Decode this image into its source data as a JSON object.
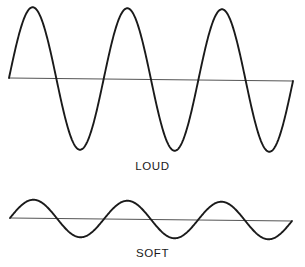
{
  "figure": {
    "background_color": "#ffffff",
    "wave_color": "#1a1a1a",
    "axis_color": "#555555",
    "width": 305,
    "height": 267
  },
  "waveforms": [
    {
      "id": "loud-waveform",
      "caption": "LOUD",
      "description": "high amplitude sound wave",
      "baseline_y": 79.5,
      "baseline_left_y": 78,
      "baseline_right_y": 81,
      "x_start": 9,
      "x_end": 293,
      "amplitude": 71,
      "cycles": 3,
      "peak_y": 9,
      "trough_y": 152,
      "peak_x": [
        30,
        126,
        222
      ],
      "trough_x": [
        80,
        174,
        270
      ],
      "stroke_width": 1.9
    },
    {
      "id": "soft-waveform",
      "caption": "SOFT",
      "description": "low amplitude sound wave",
      "baseline_y": 219,
      "baseline_left_y": 218,
      "baseline_right_y": 221,
      "x_start": 10,
      "x_end": 292,
      "amplitude": 18.5,
      "cycles": 3,
      "peak_y": 200.5,
      "trough_y": 237.5,
      "peak_x": [
        31,
        125,
        220
      ],
      "trough_x": [
        78,
        172,
        267
      ],
      "stroke_width": 1.9
    }
  ],
  "chart_data": {
    "type": "line",
    "title": "",
    "xlabel": "",
    "ylabel": "",
    "grid": false,
    "legend": "none",
    "annotations": [
      "LOUD",
      "SOFT"
    ],
    "series": [
      {
        "name": "LOUD",
        "waveform": "sine",
        "cycles": 3,
        "amplitude_px": 71,
        "relative_amplitude": 1.0,
        "baseline_y_px": 79.5
      },
      {
        "name": "SOFT",
        "waveform": "sine",
        "cycles": 3,
        "amplitude_px": 18.5,
        "relative_amplitude": 0.26,
        "baseline_y_px": 219
      }
    ]
  }
}
